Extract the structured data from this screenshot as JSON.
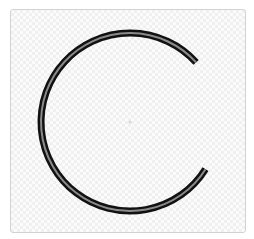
{
  "canvas": {
    "background": "checkerboard",
    "border_color": "#d2d2d2"
  },
  "shape": {
    "type": "open-arc",
    "center": [
      129,
      121
    ],
    "radius": 89,
    "start_angle_deg": -42,
    "end_angle_deg": 32,
    "sweep": "counterclockwise-gap-right",
    "outer_stroke_color": "#111111",
    "inner_stroke_color": "#8a8a8a",
    "outer_stroke_width": 7,
    "inner_stroke_width": 2
  },
  "center_marker": {
    "color": "#d8d8d8"
  }
}
